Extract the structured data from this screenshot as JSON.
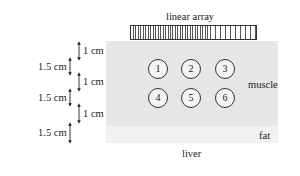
{
  "diagram": {
    "transducer": {
      "label": "linear array"
    },
    "layers": [
      {
        "name": "muscle",
        "label": "muscle",
        "color": "#e6e6e6"
      },
      {
        "name": "fat",
        "label": "fat",
        "color": "#f1f1f1"
      },
      {
        "name": "liver",
        "label": "liver",
        "color": "#ffffff"
      }
    ],
    "targets": [
      {
        "id": "1",
        "label": "1"
      },
      {
        "id": "2",
        "label": "2"
      },
      {
        "id": "3",
        "label": "3"
      },
      {
        "id": "4",
        "label": "4"
      },
      {
        "id": "5",
        "label": "5"
      },
      {
        "id": "6",
        "label": "6"
      }
    ],
    "dimensions": [
      {
        "label": "1 cm"
      },
      {
        "label": "1.5 cm"
      },
      {
        "label": "1 cm"
      },
      {
        "label": "1.5 cm"
      },
      {
        "label": "1 cm"
      },
      {
        "label": "1.5 cm"
      }
    ]
  }
}
